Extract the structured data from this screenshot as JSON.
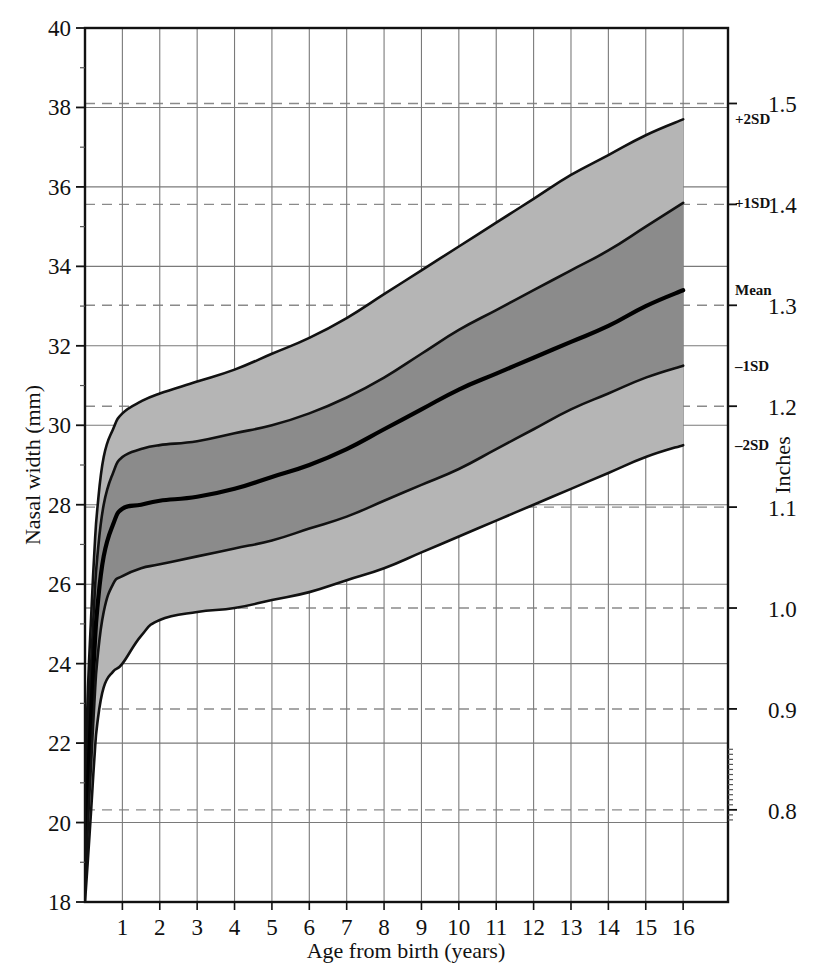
{
  "chart_data": {
    "type": "line",
    "title": "",
    "xlabel": "Age from birth (years)",
    "ylabel": "Nasal width (mm)",
    "ylabel_right": "Inches",
    "xlim": [
      0,
      17.2
    ],
    "ylim": [
      18,
      40
    ],
    "ylim_right": [
      0.709,
      1.575
    ],
    "grid": true,
    "legend_position": "inline-right-of-curve-ends",
    "x_ticks": [
      1,
      2,
      3,
      4,
      5,
      6,
      7,
      8,
      9,
      10,
      11,
      12,
      13,
      14,
      15,
      16
    ],
    "y_ticks": [
      18,
      20,
      22,
      24,
      26,
      28,
      30,
      32,
      34,
      36,
      38,
      40
    ],
    "y_ticks_right": [
      0.8,
      0.9,
      1.0,
      1.1,
      1.2,
      1.3,
      1.4,
      1.5
    ],
    "y_ticks_right_mm": [
      20.32,
      22.86,
      25.4,
      27.94,
      30.48,
      33.02,
      35.56,
      38.1
    ],
    "x": [
      0,
      0.08,
      0.17,
      0.25,
      0.33,
      0.5,
      0.75,
      1,
      1.5,
      2,
      3,
      4,
      5,
      6,
      7,
      8,
      9,
      10,
      11,
      12,
      13,
      14,
      15,
      16
    ],
    "series": [
      {
        "name": "+2SD",
        "label": "+2SD",
        "values": [
          21.1,
          23.4,
          25.3,
          26.8,
          27.9,
          29.2,
          29.9,
          30.3,
          30.6,
          30.8,
          31.1,
          31.4,
          31.8,
          32.2,
          32.7,
          33.3,
          33.9,
          34.5,
          35.1,
          35.7,
          36.3,
          36.8,
          37.3,
          37.7
        ]
      },
      {
        "name": "+1SD",
        "label": "+1SD",
        "values": [
          20.0,
          22.2,
          24.1,
          25.6,
          26.7,
          28.0,
          28.8,
          29.2,
          29.4,
          29.5,
          29.6,
          29.8,
          30.0,
          30.3,
          30.7,
          31.2,
          31.8,
          32.4,
          32.9,
          33.4,
          33.9,
          34.4,
          35.0,
          35.6
        ]
      },
      {
        "name": "Mean",
        "label": "Mean",
        "values": [
          19.0,
          21.0,
          22.8,
          24.3,
          25.4,
          26.7,
          27.5,
          27.9,
          28.0,
          28.1,
          28.2,
          28.4,
          28.7,
          29.0,
          29.4,
          29.9,
          30.4,
          30.9,
          31.3,
          31.7,
          32.1,
          32.5,
          33.0,
          33.4
        ]
      },
      {
        "name": "-1SD",
        "label": "–1SD",
        "values": [
          18.3,
          20.0,
          21.6,
          23.0,
          24.1,
          25.3,
          26.0,
          26.2,
          26.4,
          26.5,
          26.7,
          26.9,
          27.1,
          27.4,
          27.7,
          28.1,
          28.5,
          28.9,
          29.4,
          29.9,
          30.4,
          30.8,
          31.2,
          31.5
        ]
      },
      {
        "name": "-2SD",
        "label": "–2SD",
        "values": [
          18.0,
          19.1,
          20.4,
          21.6,
          22.5,
          23.4,
          23.8,
          24.0,
          24.7,
          25.1,
          25.3,
          25.4,
          25.6,
          25.8,
          26.1,
          26.4,
          26.8,
          27.2,
          27.6,
          28.0,
          28.4,
          28.8,
          29.2,
          29.5
        ]
      }
    ],
    "bands": [
      {
        "name": "outer-upper",
        "upper": "+2SD",
        "lower": "+1SD",
        "color": "#b5b5b5"
      },
      {
        "name": "inner-upper",
        "upper": "+1SD",
        "lower": "Mean",
        "color": "#8b8b8b"
      },
      {
        "name": "inner-lower",
        "upper": "Mean",
        "lower": "-1SD",
        "color": "#8b8b8b"
      },
      {
        "name": "outer-lower",
        "upper": "-1SD",
        "lower": "-2SD",
        "color": "#b5b5b5"
      }
    ],
    "colors": {
      "band_outer": "#b5b5b5",
      "band_inner": "#8b8b8b",
      "curve": "#111111",
      "mean_curve": "#000000",
      "grid_solid": "#7a7a7a",
      "grid_dashed": "#8a8a8a",
      "axis": "#111111",
      "background": "#ffffff"
    }
  },
  "axes": {
    "left": {
      "title": "Nasal width (mm)",
      "labels": [
        "40",
        "38",
        "36",
        "34",
        "32",
        "30",
        "28",
        "26",
        "24",
        "22",
        "20",
        "18"
      ]
    },
    "right": {
      "title": "Inches",
      "labels": [
        "1.5",
        "1.4",
        "1.3",
        "1.2",
        "1.1",
        "1.0",
        "0.9",
        "0.8"
      ]
    },
    "bottom": {
      "title": "Age from birth (years)",
      "labels": [
        "1",
        "2",
        "3",
        "4",
        "5",
        "6",
        "7",
        "8",
        "9",
        "10",
        "11",
        "12",
        "13",
        "14",
        "15",
        "16"
      ]
    }
  },
  "curve_labels": [
    {
      "text": "+2SD"
    },
    {
      "text": "+1SD"
    },
    {
      "text": "Mean"
    },
    {
      "text": "–1SD"
    },
    {
      "text": "–2SD"
    }
  ]
}
